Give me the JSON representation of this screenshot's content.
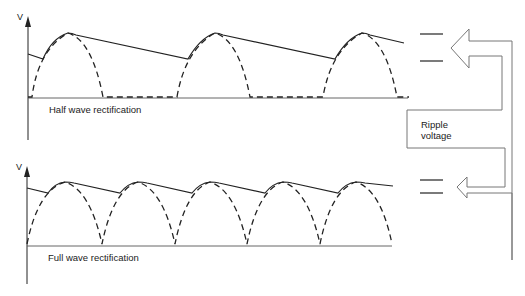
{
  "top_panel": {
    "axis_label": "V",
    "caption": "Half wave rectification"
  },
  "bottom_panel": {
    "axis_label": "V",
    "caption": "Full wave rectification"
  },
  "annotation": {
    "label_line1": "Ripple",
    "label_line2": "voltage"
  },
  "colors": {
    "stroke": "#222222",
    "arrow": "#777777",
    "background": "#ffffff"
  }
}
